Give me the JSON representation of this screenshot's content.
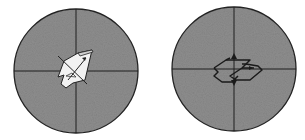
{
  "figure": {
    "panels": [
      {
        "id": "left",
        "description": "circular field of view with crosshair; tilted crystal fragment with diagonal extinction lines",
        "center": [
          76,
          71
        ],
        "radius": 62
      },
      {
        "id": "right",
        "description": "circular field of view with crosshair; flat stepped crystal plate with vertical arrow",
        "center": [
          234,
          69
        ],
        "radius": 62
      }
    ],
    "colors": {
      "field": "#8e8e8e",
      "outline": "#222222",
      "crosshair": "#1e1e1e",
      "crystal_fill": "#f2f2f2",
      "background": "#ffffff"
    }
  }
}
